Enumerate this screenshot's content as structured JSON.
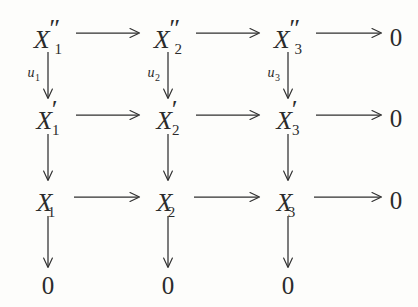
{
  "diagram": {
    "type": "commutative-diagram",
    "background_color": "#fdfdfb",
    "ink_color": "#2b2b2b",
    "zero_label": "0",
    "rows": [
      {
        "name": "row-double-prime",
        "y": 37,
        "objects": [
          {
            "base": "X",
            "prime": "″",
            "sub": "1"
          },
          {
            "base": "X",
            "prime": "″",
            "sub": "2"
          },
          {
            "base": "X",
            "prime": "″",
            "sub": "3"
          }
        ],
        "terminal": "0"
      },
      {
        "name": "row-single-prime",
        "y": 118,
        "objects": [
          {
            "base": "X",
            "prime": "′",
            "sub": "1"
          },
          {
            "base": "X",
            "prime": "′",
            "sub": "2"
          },
          {
            "base": "X",
            "prime": "′",
            "sub": "3"
          }
        ],
        "terminal": "0"
      },
      {
        "name": "row-plain",
        "y": 200,
        "objects": [
          {
            "base": "X",
            "prime": "",
            "sub": "1"
          },
          {
            "base": "X",
            "prime": "",
            "sub": "2"
          },
          {
            "base": "X",
            "prime": "",
            "sub": "3"
          }
        ],
        "terminal": "0"
      },
      {
        "name": "row-zero",
        "y": 285,
        "objects": [
          {
            "base": "0",
            "prime": "",
            "sub": ""
          },
          {
            "base": "0",
            "prime": "",
            "sub": ""
          },
          {
            "base": "0",
            "prime": "",
            "sub": ""
          }
        ],
        "terminal": ""
      }
    ],
    "columns_x": [
      48,
      168,
      288,
      396
    ],
    "vertical_labels": [
      {
        "name": "u-1",
        "sym": "u",
        "sub": "1",
        "x": 40,
        "y": 74
      },
      {
        "name": "u-2",
        "sym": "u",
        "sub": "2",
        "x": 160,
        "y": 74
      },
      {
        "name": "u-3",
        "sym": "u",
        "sub": "3",
        "x": 280,
        "y": 74
      }
    ]
  }
}
